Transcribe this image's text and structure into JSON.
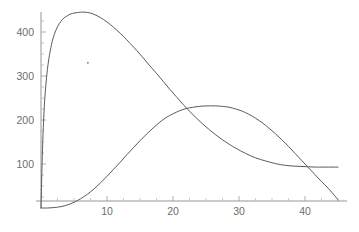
{
  "chart_data": {
    "type": "line",
    "title": "",
    "subtitle": "",
    "xlabel": "",
    "ylabel": "",
    "xlim": [
      0,
      45.5
    ],
    "ylim": [
      0,
      470
    ],
    "grid": false,
    "legend": "none",
    "x_ticks": [
      10,
      20,
      30,
      40
    ],
    "x_tick_labels": [
      "10",
      "20",
      "30",
      "40"
    ],
    "x_minor_ticks": [
      2.5,
      5,
      7.5,
      12.5,
      15,
      17.5,
      22.5,
      25,
      27.5,
      32.5,
      35,
      37.5,
      42.5,
      45
    ],
    "y_ticks": [
      100,
      200,
      300,
      400
    ],
    "y_tick_labels": [
      "100",
      "200",
      "300",
      "400"
    ],
    "y_minor_ticks": [
      25,
      50,
      75,
      125,
      150,
      175,
      225,
      250,
      275,
      325,
      350,
      375,
      425
    ],
    "colors": {
      "curve": "#5a5a5a",
      "axis": "#8a8a8a",
      "tick_label": "#6d6d6d",
      "background": "#ffffff",
      "marker": "#9a9a9a"
    },
    "annotations": [
      {
        "name": "stray-dot",
        "x": 7.1,
        "y": 330
      }
    ],
    "series": [
      {
        "name": "early-peak-curve",
        "peak": {
          "x": 6.7,
          "y": 445
        },
        "points": [
          [
            0.0,
            0
          ],
          [
            0.2,
            120
          ],
          [
            0.4,
            200
          ],
          [
            0.6,
            255
          ],
          [
            0.9,
            305
          ],
          [
            1.2,
            340
          ],
          [
            1.6,
            372
          ],
          [
            2.0,
            394
          ],
          [
            2.5,
            412
          ],
          [
            3.0,
            424
          ],
          [
            3.5,
            432
          ],
          [
            4.0,
            437
          ],
          [
            4.5,
            441
          ],
          [
            5.0,
            443
          ],
          [
            5.5,
            444
          ],
          [
            6.0,
            445
          ],
          [
            6.7,
            445
          ],
          [
            7.5,
            443
          ],
          [
            8.5,
            437
          ],
          [
            9.5,
            428
          ],
          [
            10.5,
            417
          ],
          [
            11.5,
            404
          ],
          [
            12.5,
            390
          ],
          [
            13.5,
            374
          ],
          [
            14.5,
            358
          ],
          [
            15.5,
            341
          ],
          [
            16.5,
            323
          ],
          [
            17.5,
            306
          ],
          [
            18.5,
            288
          ],
          [
            19.5,
            270
          ],
          [
            20.5,
            253
          ],
          [
            21.5,
            236
          ],
          [
            22.5,
            220
          ],
          [
            23.5,
            205
          ],
          [
            24.5,
            191
          ],
          [
            25.5,
            178
          ],
          [
            26.5,
            166
          ],
          [
            27.5,
            155
          ],
          [
            28.5,
            145
          ],
          [
            29.5,
            136
          ],
          [
            31.0,
            124
          ],
          [
            32.5,
            114
          ],
          [
            34.0,
            107
          ],
          [
            35.5,
            101
          ],
          [
            37.0,
            97
          ],
          [
            38.5,
            95
          ],
          [
            40.0,
            94
          ],
          [
            41.5,
            93
          ],
          [
            43.0,
            93
          ],
          [
            45.0,
            93
          ]
        ]
      },
      {
        "name": "late-peak-curve",
        "peak": {
          "x": 26.4,
          "y": 232
        },
        "points": [
          [
            0.0,
            0
          ],
          [
            1.0,
            0
          ],
          [
            2.0,
            1
          ],
          [
            3.0,
            3
          ],
          [
            4.0,
            7
          ],
          [
            5.0,
            13
          ],
          [
            6.0,
            21
          ],
          [
            7.0,
            31
          ],
          [
            8.0,
            43
          ],
          [
            9.0,
            57
          ],
          [
            10.0,
            72
          ],
          [
            11.0,
            88
          ],
          [
            12.0,
            104
          ],
          [
            13.0,
            121
          ],
          [
            14.0,
            137
          ],
          [
            15.0,
            153
          ],
          [
            16.0,
            168
          ],
          [
            17.0,
            182
          ],
          [
            18.0,
            195
          ],
          [
            19.0,
            206
          ],
          [
            20.0,
            214
          ],
          [
            21.0,
            221
          ],
          [
            22.0,
            226
          ],
          [
            23.0,
            229
          ],
          [
            24.0,
            231
          ],
          [
            25.0,
            232
          ],
          [
            26.4,
            232
          ],
          [
            27.5,
            231
          ],
          [
            28.5,
            229
          ],
          [
            29.5,
            225
          ],
          [
            30.5,
            220
          ],
          [
            31.5,
            213
          ],
          [
            32.5,
            204
          ],
          [
            33.5,
            194
          ],
          [
            34.5,
            182
          ],
          [
            35.5,
            169
          ],
          [
            36.5,
            155
          ],
          [
            37.5,
            140
          ],
          [
            38.5,
            124
          ],
          [
            39.5,
            108
          ],
          [
            40.5,
            92
          ],
          [
            41.5,
            76
          ],
          [
            42.5,
            60
          ],
          [
            43.5,
            45
          ],
          [
            44.5,
            28
          ],
          [
            45.0,
            18
          ]
        ]
      }
    ]
  }
}
